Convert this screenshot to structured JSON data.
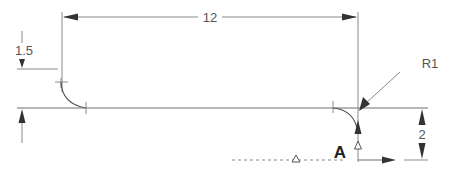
{
  "drawing": {
    "dimensions": {
      "overall_length": "12",
      "step_height": "1.5",
      "datum_offset": "2",
      "radius": "R1"
    },
    "datum_label": "A",
    "colors": {
      "line": "#6e6e6e",
      "arrow": "#333333",
      "text": "#555555",
      "background": "#ffffff"
    }
  }
}
